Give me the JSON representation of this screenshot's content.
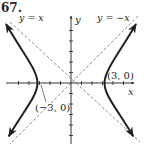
{
  "problem_number": "67.",
  "graph": {
    "equation_description": "Hyperbola with vertices (-3, 0) and (3, 0), asymptotes y = x and y = -x",
    "axes": {
      "x_label": "x",
      "y_label": "y"
    },
    "asymptotes": [
      {
        "label": "y = x",
        "slope": 1
      },
      {
        "label": "y = −x",
        "slope": -1
      }
    ],
    "vertices": [
      {
        "label": "(3, 0)",
        "x": 3,
        "y": 0
      },
      {
        "label": "(−3, 0)",
        "x": -3,
        "y": 0
      }
    ],
    "colors": {
      "ink": "#231f20",
      "dashed": "#6d6e71"
    }
  }
}
